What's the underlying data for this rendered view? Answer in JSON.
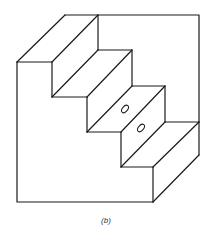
{
  "figure": {
    "caption": "(b)",
    "steps": 4,
    "holes": 2,
    "line_color": "#1a1a1a",
    "background": "#ffffff"
  }
}
